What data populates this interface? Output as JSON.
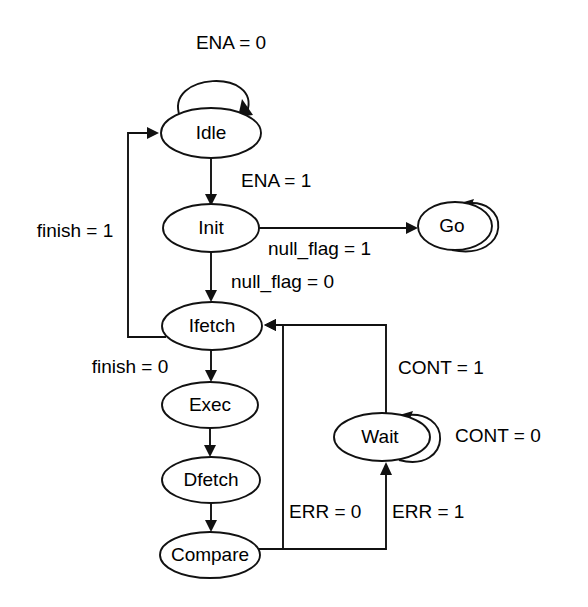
{
  "diagram": {
    "type": "finite-state-machine",
    "background_color": "#ffffff",
    "line_color": "#111111",
    "text_color": "#000000"
  },
  "states": [
    {
      "id": "idle",
      "label": "Idle",
      "cx": 211,
      "cy": 133,
      "rx": 50,
      "ry": 25
    },
    {
      "id": "init",
      "label": "Init",
      "cx": 211,
      "cy": 228,
      "rx": 48,
      "ry": 24
    },
    {
      "id": "go",
      "label": "Go",
      "cx": 455,
      "cy": 226,
      "rx": 37,
      "ry": 24
    },
    {
      "id": "ifetch",
      "label": "Ifetch",
      "cx": 212,
      "cy": 326,
      "rx": 50,
      "ry": 24
    },
    {
      "id": "exec",
      "label": "Exec",
      "cx": 210,
      "cy": 405,
      "rx": 48,
      "ry": 23
    },
    {
      "id": "dfetch",
      "label": "Dfetch",
      "cx": 211,
      "cy": 480,
      "rx": 49,
      "ry": 23
    },
    {
      "id": "compare",
      "label": "Compare",
      "cx": 210,
      "cy": 555,
      "rx": 50,
      "ry": 23
    },
    {
      "id": "wait",
      "label": "Wait",
      "cx": 382,
      "cy": 437,
      "rx": 48,
      "ry": 24
    }
  ],
  "transitions": [
    {
      "id": "idle-self",
      "from": "idle",
      "to": "idle",
      "label": "ENA = 0",
      "label_x": 231,
      "label_y": 44,
      "anchor": "middle"
    },
    {
      "id": "idle-init",
      "from": "idle",
      "to": "init",
      "label": "ENA = 1",
      "label_x": 241,
      "label_y": 182,
      "anchor": "start"
    },
    {
      "id": "init-go",
      "from": "init",
      "to": "go",
      "label": "null_flag = 1",
      "label_x": 268,
      "label_y": 250,
      "anchor": "start"
    },
    {
      "id": "go-self",
      "from": "go",
      "to": "go",
      "label": "",
      "label_x": 0,
      "label_y": 0,
      "anchor": "start"
    },
    {
      "id": "init-ifetch",
      "from": "init",
      "to": "ifetch",
      "label": "null_flag = 0",
      "label_x": 231,
      "label_y": 283,
      "anchor": "start"
    },
    {
      "id": "ifetch-idle",
      "from": "ifetch",
      "to": "idle",
      "label": "finish = 1",
      "label_x": 75,
      "label_y": 232,
      "anchor": "middle"
    },
    {
      "id": "ifetch-exec",
      "from": "ifetch",
      "to": "exec",
      "label": "finish = 0",
      "label_x": 130,
      "label_y": 368,
      "anchor": "middle"
    },
    {
      "id": "exec-dfetch",
      "from": "exec",
      "to": "dfetch",
      "label": "",
      "label_x": 0,
      "label_y": 0,
      "anchor": "start"
    },
    {
      "id": "dfetch-compare",
      "from": "dfetch",
      "to": "compare",
      "label": "",
      "label_x": 0,
      "label_y": 0,
      "anchor": "start"
    },
    {
      "id": "compare-ifetch",
      "from": "compare",
      "to": "ifetch",
      "label": "ERR = 0",
      "label_x": 289,
      "label_y": 513,
      "anchor": "start"
    },
    {
      "id": "compare-wait",
      "from": "compare",
      "to": "wait",
      "label": "ERR = 1",
      "label_x": 392,
      "label_y": 513,
      "anchor": "start"
    },
    {
      "id": "wait-self",
      "from": "wait",
      "to": "wait",
      "label": "CONT = 0",
      "label_x": 455,
      "label_y": 437,
      "anchor": "start"
    },
    {
      "id": "wait-ifetch",
      "from": "wait",
      "to": "ifetch",
      "label": "CONT = 1",
      "label_x": 398,
      "label_y": 369,
      "anchor": "start"
    }
  ]
}
